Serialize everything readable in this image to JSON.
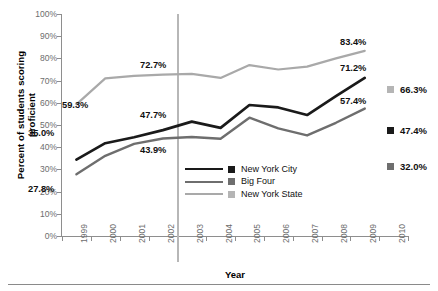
{
  "chart_data": {
    "type": "line",
    "title": "",
    "xlabel": "Year",
    "ylabel": "Percent of students scoring proficient",
    "xlim": [
      1999,
      2010
    ],
    "ylim": [
      0,
      100
    ],
    "grid": false,
    "legend_position": "inside-bottom-center",
    "x": [
      1999,
      2000,
      2001,
      2002,
      2003,
      2004,
      2005,
      2006,
      2007,
      2008,
      2009
    ],
    "xticklabels": [
      "1999",
      "2000",
      "2001",
      "2002",
      "2003",
      "2004",
      "2005",
      "2006",
      "2007",
      "2008",
      "2009",
      "2010"
    ],
    "yticklabels": [
      "0%",
      "10%",
      "20%",
      "30%",
      "40%",
      "50%",
      "60%",
      "70%",
      "80%",
      "90%",
      "100%"
    ],
    "series": [
      {
        "name": "New York City",
        "color": "#1a1a1a",
        "values": [
          34.4,
          41.8,
          44.5,
          47.7,
          51.5,
          48.7,
          59.0,
          57.9,
          54.5,
          63.0,
          71.2
        ]
      },
      {
        "name": "Big Four",
        "color": "#6e6e6e",
        "values": [
          27.8,
          36.1,
          41.5,
          43.9,
          44.6,
          43.8,
          53.3,
          48.5,
          45.3,
          51.0,
          57.4
        ]
      },
      {
        "name": "New York State",
        "color": "#a9a9a9",
        "values": [
          59.3,
          71.0,
          72.1,
          72.7,
          73.0,
          71.2,
          77.0,
          75.0,
          76.3,
          80.0,
          83.4
        ]
      }
    ],
    "point_labels": [
      {
        "text": "59.3%",
        "series": "New York State",
        "x": 1999
      },
      {
        "text": "35.0%",
        "series": "New York City",
        "x": 1999
      },
      {
        "text": "27.8%",
        "series": "Big Four",
        "x": 1999
      },
      {
        "text": "72.7%",
        "series": "New York State",
        "x": 2002
      },
      {
        "text": "47.7%",
        "series": "New York City",
        "x": 2002
      },
      {
        "text": "43.9%",
        "series": "Big Four",
        "x": 2002
      },
      {
        "text": "83.4%",
        "series": "New York State",
        "x": 2009
      },
      {
        "text": "71.2%",
        "series": "New York City",
        "x": 2009
      },
      {
        "text": "57.4%",
        "series": "Big Four",
        "x": 2009
      }
    ],
    "side_annotations": [
      {
        "text": "66.3%",
        "color": "#a9a9a9",
        "series": "New York State"
      },
      {
        "text": "47.4%",
        "color": "#1a1a1a",
        "series": "New York City"
      },
      {
        "text": "32.0%",
        "color": "#6e6e6e",
        "series": "Big Four"
      }
    ],
    "reference_line": {
      "x": 2002.5,
      "color": "#b7b7b7"
    }
  },
  "axes": {
    "ylabel": "Percent of students scoring proficient",
    "xlabel": "Year",
    "yticks": [
      "100%",
      "90%",
      "80%",
      "70%",
      "60%",
      "50%",
      "40%",
      "30%",
      "20%",
      "10%",
      "0%"
    ],
    "xticks": [
      "1999",
      "2000",
      "2001",
      "2002",
      "2003",
      "2004",
      "2005",
      "2006",
      "2007",
      "2008",
      "2009",
      "2010"
    ]
  },
  "legend": {
    "items": [
      {
        "label": "New York City",
        "color": "#1a1a1a"
      },
      {
        "label": "Big Four",
        "color": "#6e6e6e"
      },
      {
        "label": "New York State",
        "color": "#a9a9a9"
      }
    ]
  },
  "labels": {
    "p0": "59.3%",
    "p1": "35.0%",
    "p2": "27.8%",
    "p3": "72.7%",
    "p4": "47.7%",
    "p5": "43.9%",
    "p6": "83.4%",
    "p7": "71.2%",
    "p8": "57.4%"
  },
  "side": {
    "s0": "66.3%",
    "s1": "47.4%",
    "s2": "32.0%"
  }
}
